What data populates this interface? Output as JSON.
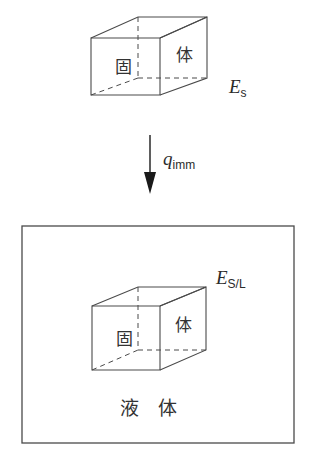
{
  "figure": {
    "title": "",
    "background_color": "#ffffff",
    "line_color": "#4a4a4a",
    "text_color": "#2b2b2b",
    "top_solid": {
      "face_front_label": "固",
      "face_right_label": "体",
      "energy_label_var": "E",
      "energy_label_sub": "s"
    },
    "arrow": {
      "label_var": "q",
      "label_sub": "imm",
      "direction": "down"
    },
    "bottom_container": {
      "liquid_label": "液　体",
      "energy_label_var": "E",
      "energy_label_sub": "S/L",
      "solid": {
        "face_front_label": "固",
        "face_right_label": "体"
      }
    }
  }
}
